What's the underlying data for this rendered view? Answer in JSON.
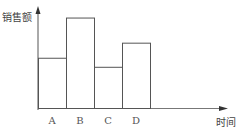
{
  "chart_data": {
    "type": "bar",
    "title": "",
    "xlabel": "时间",
    "ylabel": "销售额",
    "categories": [
      "A",
      "B",
      "C",
      "D"
    ],
    "values": [
      50,
      90,
      41,
      65
    ],
    "ylim": [
      0,
      100
    ],
    "grid": false,
    "legend": null,
    "bar_style": "outline, no fill, adjacent (histogram-like)"
  },
  "axes": {
    "y_label": "销售额",
    "x_label": "时间"
  },
  "colors": {
    "stroke": "#555555",
    "background": "#ffffff"
  }
}
